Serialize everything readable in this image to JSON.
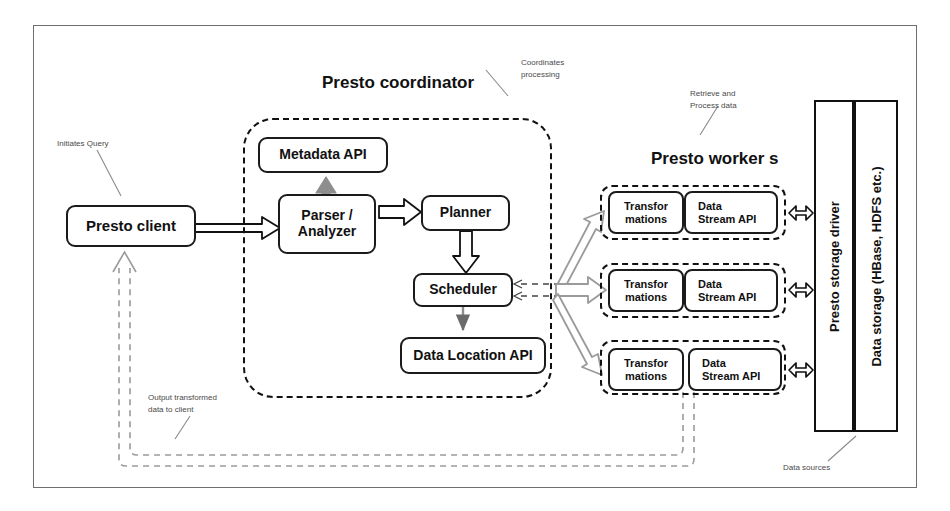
{
  "diagram": {
    "frame": {
      "name": "diagram-frame"
    }
  },
  "titles": {
    "coordinator": "Presto coordinator",
    "workers": "Presto  worker s"
  },
  "notes": {
    "initiates_query": "Initiates Query",
    "coordinates_processing_line1": "Coordinates",
    "coordinates_processing_line2": "processing",
    "retrieve_line1": "Retrieve and",
    "retrieve_line2": "Process data",
    "output_line1": "Output transformed",
    "output_line2": "data to client",
    "data_sources": "Data sources"
  },
  "client": {
    "label": "Presto client"
  },
  "coordinator": {
    "metadata_api": "Metadata API",
    "parser_line1": "Parser /",
    "parser_line2": "Analyzer",
    "planner": "Planner",
    "scheduler": "Scheduler",
    "data_location_api": "Data Location  API"
  },
  "workers": [
    {
      "transformations_line1": "Transfor",
      "transformations_line2": "mations",
      "stream_line1": "Data",
      "stream_line2": "Stream API"
    },
    {
      "transformations_line1": "Transfor",
      "transformations_line2": "mations",
      "stream_line1": "Data",
      "stream_line2": "Stream API"
    },
    {
      "transformations_line1": "Transfor",
      "transformations_line2": "mations",
      "stream_line1": "Data",
      "stream_line2": "Stream API"
    }
  ],
  "storage": {
    "driver": "Presto storage driver",
    "data_storage": "Data storage (HBase, HDFS etc.)"
  },
  "colors": {
    "stroke": "#111111",
    "frame": "#6f6f6f",
    "note_text": "#4a4a4a",
    "gray_arrow": "#8d8d8d",
    "dashed_return": "#9a9a9a"
  }
}
